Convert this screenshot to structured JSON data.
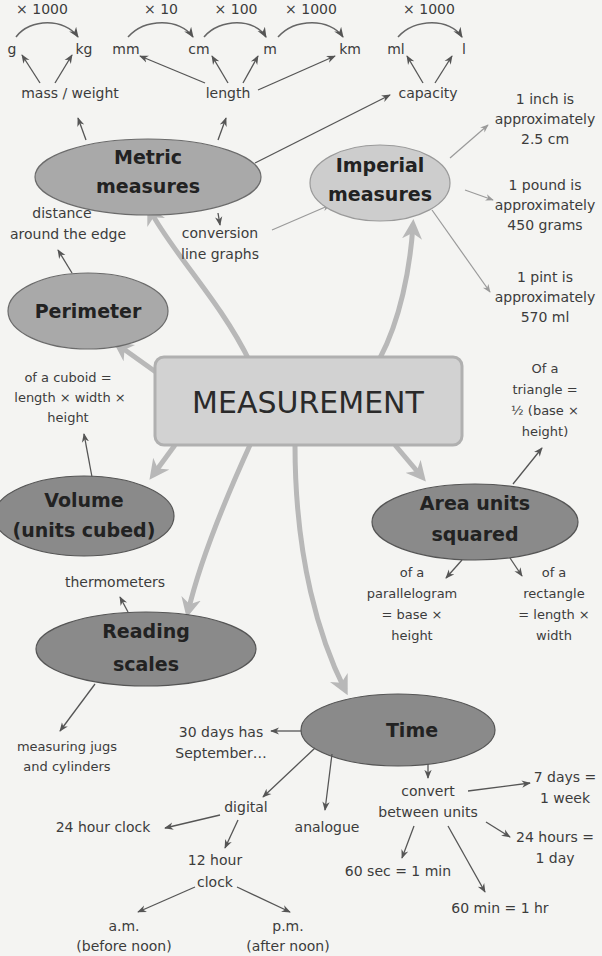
{
  "center": {
    "label": "MEASUREMENT"
  },
  "metric": {
    "title_line1": "Metric",
    "title_line2": "measures",
    "factors": [
      "× 1000",
      "× 10",
      "× 100",
      "× 1000",
      "× 1000"
    ],
    "units": {
      "g": "g",
      "kg": "kg",
      "mm": "mm",
      "cm": "cm",
      "m": "m",
      "km": "km",
      "ml": "ml",
      "l": "l"
    },
    "groups": {
      "mass": "mass / weight",
      "length": "length",
      "capacity": "capacity"
    },
    "conversion_line1": "conversion",
    "conversion_line2": "line graphs"
  },
  "imperial": {
    "title_line1": "Imperial",
    "title_line2": "measures",
    "facts": [
      {
        "l1": "1 inch is",
        "l2": "approximately",
        "l3": "2.5 cm"
      },
      {
        "l1": "1 pound is",
        "l2": "approximately",
        "l3": "450 grams"
      },
      {
        "l1": "1 pint is",
        "l2": "approximately",
        "l3": "570 ml"
      }
    ]
  },
  "perimeter": {
    "title": "Perimeter",
    "desc_line1": "distance",
    "desc_line2": "around the edge"
  },
  "volume": {
    "title_line1": "Volume",
    "title_line2": "(units cubed)",
    "desc": [
      "of a cuboid =",
      "length × width ×",
      "height"
    ]
  },
  "area": {
    "title_line1": "Area units",
    "title_line2": "squared",
    "triangle": [
      "Of a",
      "triangle =",
      "½ (base ×",
      "height)"
    ],
    "parallelogram": [
      "of a",
      "parallelogram",
      "= base ×",
      "height"
    ],
    "rectangle": [
      "of a",
      "rectangle",
      "= length ×",
      "width"
    ]
  },
  "reading": {
    "title_line1": "Reading",
    "title_line2": "scales",
    "thermometers": "thermometers",
    "jugs": [
      "measuring jugs",
      "and cylinders"
    ]
  },
  "time": {
    "title": "Time",
    "september": [
      "30 days has",
      "September…"
    ],
    "digital": "digital",
    "analogue": "analogue",
    "clock24": "24 hour clock",
    "clock12": [
      "12 hour",
      "clock"
    ],
    "am": [
      "a.m.",
      "(before noon)"
    ],
    "pm": [
      "p.m.",
      "(after noon)"
    ],
    "convert": [
      "convert",
      "between units"
    ],
    "conversions": {
      "week": [
        "7 days =",
        "1 week"
      ],
      "day": [
        "24 hours =",
        "1 day"
      ],
      "min": "60 sec = 1 min",
      "hr": "60 min = 1 hr"
    }
  },
  "colors": {
    "background": "#f4f4f2",
    "dark_node": "#8a8a8a",
    "mid_node": "#a9a9a9",
    "light_node": "#cdcdcd",
    "center_box": "#d2d2d2",
    "connector": "#b8b8b8"
  }
}
